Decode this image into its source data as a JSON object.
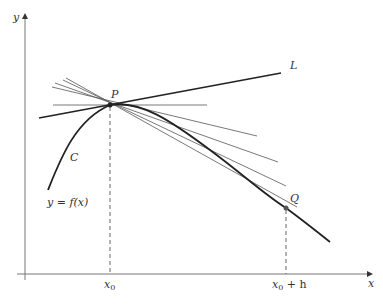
{
  "figure": {
    "axes": {
      "x_label": "x",
      "y_label": "y"
    },
    "curve": {
      "name": "C",
      "equation": "y = f(x)"
    },
    "points": {
      "P": {
        "label": "P"
      },
      "Q": {
        "label": "Q"
      }
    },
    "tangent_line": {
      "label": "L"
    },
    "x_ticks": {
      "x0": "x",
      "x0_sub": "0",
      "x0h": "x",
      "x0h_sub": "0",
      "x0h_suffix": " + h"
    },
    "colors": {
      "curve": "#222222",
      "secants": "#555555",
      "axes": "#666666",
      "dashed": "#555555"
    }
  }
}
